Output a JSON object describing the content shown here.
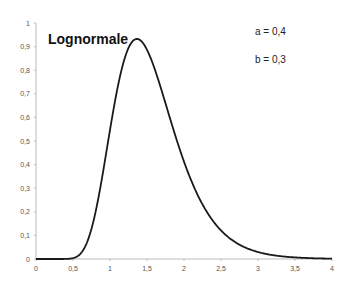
{
  "chart_data": {
    "type": "line",
    "title": "Lognormale",
    "annotations": [
      "a = 0,4",
      "b = 0,3"
    ],
    "xlabel": "",
    "ylabel": "",
    "xlim": [
      0,
      4
    ],
    "ylim": [
      0,
      1
    ],
    "x_ticks": [
      "0",
      "0,5",
      "1",
      "1,5",
      "2",
      "2,5",
      "3",
      "3,5",
      "4"
    ],
    "y_ticks": [
      "0",
      "0,1",
      "0,2",
      "0,3",
      "0,4",
      "0,5",
      "0,6",
      "0,7",
      "0,8",
      "0,9",
      "1"
    ],
    "grid": false,
    "legend": "none",
    "series": [
      {
        "name": "Lognormale (a=0.4, b=0.3)",
        "x": [
          0,
          0.5,
          0.6,
          0.7,
          0.8,
          0.9,
          1.0,
          1.1,
          1.2,
          1.3,
          1.36,
          1.4,
          1.5,
          1.6,
          1.7,
          1.8,
          1.9,
          2.0,
          2.2,
          2.4,
          2.6,
          2.8,
          3.0,
          3.2,
          3.4,
          3.6,
          3.8,
          4.0
        ],
        "y": [
          0,
          0.003,
          0.021,
          0.081,
          0.198,
          0.366,
          0.548,
          0.71,
          0.831,
          0.903,
          0.935,
          0.931,
          0.896,
          0.82,
          0.721,
          0.614,
          0.508,
          0.41,
          0.253,
          0.148,
          0.083,
          0.045,
          0.024,
          0.012,
          0.006,
          0.003,
          0.0015,
          0.0007
        ],
        "color": "#1a1a1a"
      }
    ]
  }
}
